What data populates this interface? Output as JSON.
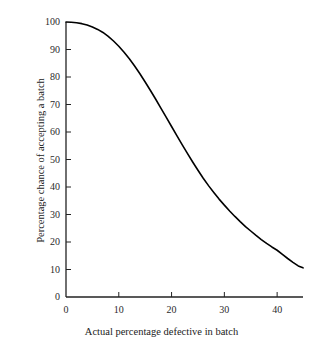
{
  "chart_data": {
    "type": "line",
    "title": "",
    "subtitle": "",
    "xlabel": "Actual percentage defective in batch",
    "ylabel": "Percentage chance of accepting a batch",
    "xlim": [
      0,
      44.9
    ],
    "ylim": [
      0,
      100
    ],
    "xticks": [
      0,
      10,
      20,
      30,
      40
    ],
    "yticks": [
      0,
      10,
      20,
      30,
      40,
      50,
      60,
      70,
      80,
      90,
      100
    ],
    "xtick_labels": [
      "0",
      "10",
      "20",
      "30",
      "40"
    ],
    "ytick_labels": [
      "0",
      "10",
      "20",
      "30",
      "40",
      "50",
      "60",
      "70",
      "80",
      "90",
      "100"
    ],
    "grid": false,
    "legend": false,
    "legend_position": "none",
    "series": [
      {
        "name": "Operating characteristic curve",
        "color": "#000000",
        "line_width": 1.6,
        "x": [
          0,
          1,
          2,
          3,
          4,
          5,
          6,
          7,
          8,
          9,
          10,
          11,
          12,
          13,
          14,
          15,
          16,
          17,
          18,
          19,
          20,
          21,
          22,
          23,
          24,
          25,
          26,
          27,
          28,
          29,
          30,
          31,
          32,
          33,
          34,
          35,
          36,
          37,
          38,
          39,
          40,
          41,
          42,
          43,
          44,
          44.9
        ],
        "y": [
          100,
          99.9,
          99.7,
          99.4,
          98.9,
          98.2,
          97.3,
          96.2,
          94.8,
          93.1,
          91.2,
          89.0,
          86.6,
          84.0,
          81.2,
          78.2,
          75.1,
          71.9,
          68.6,
          65.3,
          62.0,
          58.7,
          55.4,
          52.2,
          49.1,
          46.1,
          43.2,
          40.5,
          38.0,
          35.6,
          33.4,
          31.3,
          29.3,
          27.4,
          25.6,
          24.0,
          22.4,
          20.9,
          19.5,
          18.2,
          17.0,
          15.5,
          14.0,
          12.6,
          11.3,
          10.6
        ]
      }
    ]
  },
  "axes": {
    "y_axis_name": "percentage-chance-of-accepting-a-batch",
    "x_axis_name": "actual-percentage-defective-in-batch"
  },
  "style": {
    "axis_color": "#222222",
    "curve_color": "#000000",
    "background": "#ffffff",
    "text_color": "#222222"
  }
}
